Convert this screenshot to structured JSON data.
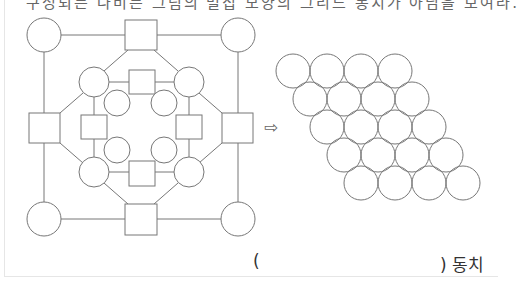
{
  "top_text": "구성되는 나비는 그림의 벌집 모양의 그리드 동치가 아님을 보여라.",
  "arrow_glyph": "⇨",
  "answer": {
    "open_paren": "(",
    "close_label": ") 동치"
  },
  "diagram": {
    "stroke_color": "#777777",
    "graph": {
      "description": "Three concentric octagonal rings of alternating circles and squares connected by line segments",
      "outer_ring": {
        "circles": 4,
        "squares": 4
      },
      "middle_ring": {
        "circles": 4,
        "squares": 4
      },
      "inner_ring": {
        "circles": 4
      }
    },
    "packing": {
      "description": "Rhombus-shaped arrangement of tangent circles",
      "rows": 5,
      "circles_per_row": 4,
      "total_circles": 20
    }
  }
}
